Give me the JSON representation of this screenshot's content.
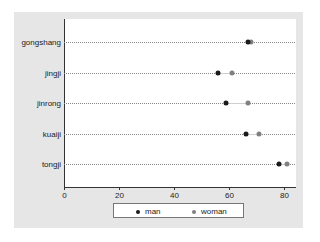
{
  "chart_data": {
    "type": "scatter",
    "subtype": "dot-plot",
    "title": "",
    "xlabel": "",
    "ylabel": "",
    "categories": [
      "gongshang",
      "jingji",
      "jinrong",
      "kuaiji",
      "tongji"
    ],
    "series": [
      {
        "name": "man",
        "color": "#1a1a1a",
        "values": [
          67,
          56,
          59,
          66,
          78
        ]
      },
      {
        "name": "woman",
        "color": "#808080",
        "values": [
          68,
          61,
          67,
          71,
          81
        ]
      }
    ],
    "xlim": [
      0,
      84
    ],
    "xticks": [
      0,
      20,
      40,
      60,
      80
    ],
    "grid": "dotted horizontal lines per category",
    "legend_position": "bottom"
  },
  "axis": {
    "ticks": [
      "0",
      "20",
      "40",
      "60",
      "80"
    ]
  },
  "legend": {
    "items": [
      {
        "label": "man",
        "color": "#1a1a1a"
      },
      {
        "label": "woman",
        "color": "#808080"
      }
    ]
  }
}
